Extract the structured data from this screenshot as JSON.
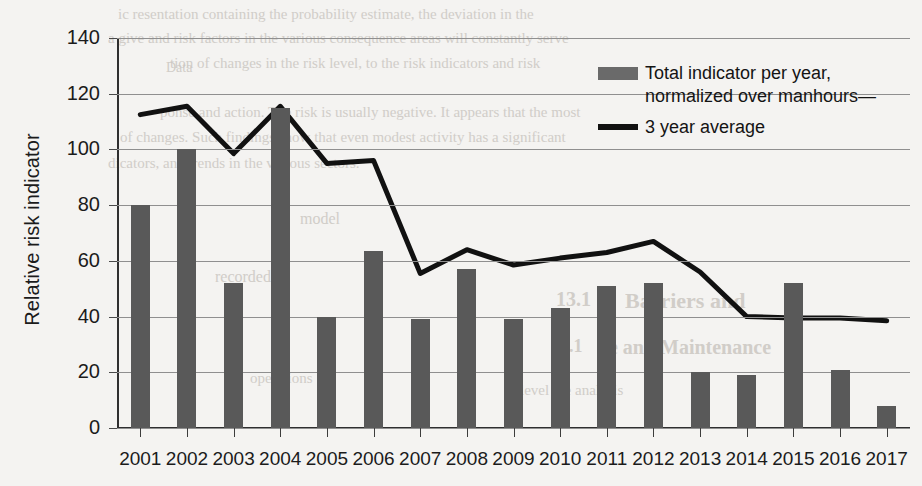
{
  "chart_data": {
    "type": "bar",
    "title": "",
    "xlabel": "",
    "ylabel": "Relative risk indicator",
    "ylim": [
      0,
      140
    ],
    "yticks": [
      0,
      20,
      40,
      60,
      80,
      100,
      120,
      140
    ],
    "grid": true,
    "legend_position": "top-right",
    "categories": [
      "2001",
      "2002",
      "2003",
      "2004",
      "2005",
      "2006",
      "2007",
      "2008",
      "2009",
      "2010",
      "2011",
      "2012",
      "2013",
      "2014",
      "2015",
      "2016",
      "2017"
    ],
    "series": [
      {
        "name": "Total indicator per year, normalized over manhours",
        "type": "bar",
        "color": "#595959",
        "values": [
          80,
          100,
          52,
          115,
          40,
          63.5,
          39,
          57,
          39,
          43,
          51,
          52,
          20,
          19,
          52,
          21,
          8
        ]
      },
      {
        "name": "3 year average",
        "type": "line",
        "color": "#111111",
        "values": [
          112.5,
          115.5,
          98.5,
          115.5,
          95,
          96,
          55.5,
          64,
          58.5,
          61,
          63,
          67,
          56,
          40,
          39.5,
          39.5,
          38.5
        ]
      }
    ]
  },
  "legend": {
    "bar_label_line1": "Total indicator per year,",
    "bar_label_line2": "normalized over manhours—",
    "line_label": "3 year average"
  },
  "ghost_text": {
    "items": [
      {
        "text": "ic resentation containing the probability estimate, the deviation in the",
        "x": 118,
        "y": 6,
        "size": 15,
        "bold": false
      },
      {
        "text": "a give  and risk factors in the various consequence areas will constantly serve",
        "x": 108,
        "y": 30,
        "size": 15,
        "bold": false
      },
      {
        "text": "tion of changes in the risk level, to the risk indicators and risk",
        "x": 170,
        "y": 55,
        "size": 15,
        "bold": false
      },
      {
        "text": "ponse and action. The risk is usually negative. It appears that the most",
        "x": 160,
        "y": 104,
        "size": 15,
        "bold": false
      },
      {
        "text": "of changes. Such findings show that even modest activity has a significant",
        "x": 120,
        "y": 129,
        "size": 15,
        "bold": false
      },
      {
        "text": "dicators, and trends in the various sectors.",
        "x": 108,
        "y": 155,
        "size": 15,
        "bold": false
      },
      {
        "text": "Barriers and",
        "x": 625,
        "y": 288,
        "size": 22,
        "bold": true
      },
      {
        "text": "ce and Maintenance",
        "x": 600,
        "y": 336,
        "size": 20,
        "bold": true
      },
      {
        "text": "13.1",
        "x": 556,
        "y": 288,
        "size": 20,
        "bold": true
      },
      {
        "text": "7.1",
        "x": 560,
        "y": 336,
        "size": 18,
        "bold": true
      },
      {
        "text": "Data",
        "x": 166,
        "y": 60,
        "size": 14,
        "bold": false
      },
      {
        "text": "model",
        "x": 300,
        "y": 210,
        "size": 16,
        "bold": false
      },
      {
        "text": "recorded",
        "x": 215,
        "y": 268,
        "size": 16,
        "bold": false
      },
      {
        "text": "level the analysis",
        "x": 520,
        "y": 382,
        "size": 15,
        "bold": false
      },
      {
        "text": "operations",
        "x": 250,
        "y": 370,
        "size": 15,
        "bold": false
      }
    ]
  }
}
